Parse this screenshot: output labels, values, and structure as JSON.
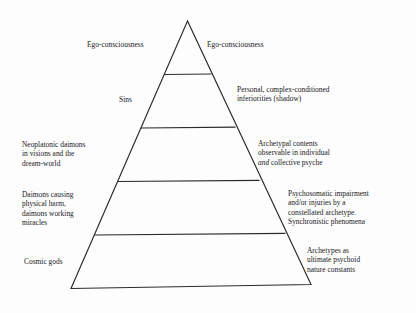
{
  "diagram": {
    "type": "pyramid",
    "title": "",
    "background_color": "#fdfdfd",
    "line_color": "#2b2b2b",
    "text_color": "#17171a",
    "tiers": [
      {
        "index": 0,
        "name": "apex-tier",
        "left_label": "Ego-consciousness",
        "right_label": "Ego-consciousness"
      },
      {
        "index": 1,
        "name": "second-tier",
        "left_label": "Sins",
        "right_label": "Personal, complex-conditioned\ninferiorities (shadow)"
      },
      {
        "index": 2,
        "name": "third-tier",
        "left_label": "Neoplatonic daimons\nin visions and the\ndream-world",
        "right_label_line1": "Archetypal contents",
        "right_label_line2": "observable in individual",
        "right_label_line3_italic": "and",
        "right_label_line3_rest": " collective psyche"
      },
      {
        "index": 3,
        "name": "fourth-tier",
        "left_label": "Daimons causing\nphysical harm,\ndaimons working\nmiracles",
        "right_label": "Psychosomatic impairment\nand/or injuries by a\nconstellated archetype.\nSynchronistic phenomena"
      },
      {
        "index": 4,
        "name": "base-tier",
        "left_label": "Cosmic gods",
        "right_label": "Archetypes as\nultimate psychoid\nnature constants"
      }
    ]
  }
}
